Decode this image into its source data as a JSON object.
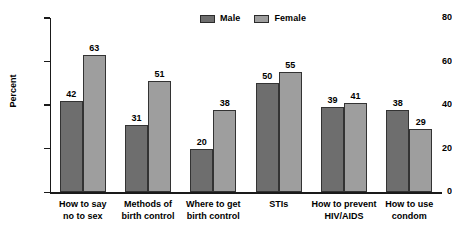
{
  "chart_data": {
    "type": "bar",
    "title": "",
    "subtitle": "",
    "xlabel": "",
    "ylabel": "Percent",
    "ylim": [
      0,
      80
    ],
    "yticks": [
      0,
      20,
      40,
      60,
      80
    ],
    "ytick_labels": [
      "0",
      "20",
      "40",
      "60",
      "80"
    ],
    "grid": false,
    "legend_position": "top-center",
    "grouped": true,
    "bar_labels_shown": true,
    "categories": [
      "How to say\nno to sex",
      "Methods of\nbirth control",
      "Where to get\nbirth control",
      "STIs",
      "How to prevent\nHIV/AIDS",
      "How to use\ncondom"
    ],
    "series": [
      {
        "name": "Male",
        "color": "#6e6e6e",
        "values": [
          42,
          31,
          20,
          50,
          39,
          38
        ],
        "value_labels": [
          "42",
          "31",
          "20",
          "50",
          "39",
          "38"
        ]
      },
      {
        "name": "Female",
        "color": "#9e9e9e",
        "values": [
          63,
          51,
          38,
          55,
          41,
          29
        ],
        "value_labels": [
          "63",
          "51",
          "38",
          "55",
          "41",
          "29"
        ]
      }
    ]
  },
  "legend": {
    "entries": [
      {
        "label": "Male",
        "color": "#6e6e6e"
      },
      {
        "label": "Female",
        "color": "#9e9e9e"
      }
    ]
  },
  "axes": {
    "y_title": "Percent",
    "y_tick_labels": [
      "80",
      "60",
      "40",
      "20",
      "0"
    ]
  }
}
